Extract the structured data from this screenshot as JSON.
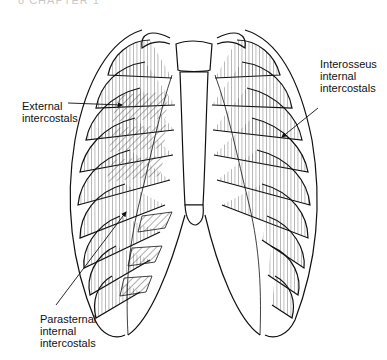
{
  "header": {
    "text": "8   CHAPTER 1"
  },
  "figure": {
    "colors": {
      "stroke": "#111111",
      "hatch": "#333333",
      "background": "#ffffff"
    },
    "labels": {
      "external": {
        "line1": "External",
        "line2": "intercostals"
      },
      "interosseus": {
        "line1": "Interosseus",
        "line2": "internal",
        "line3": "intercostals"
      },
      "parasternal": {
        "line1": "Parasternal",
        "line2": "internal",
        "line3": "intercostals"
      }
    }
  }
}
